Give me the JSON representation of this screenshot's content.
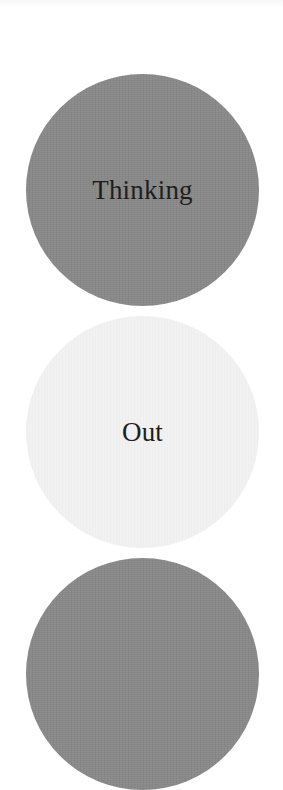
{
  "buttons": [
    {
      "label": "Thinking",
      "state": "selected",
      "fill": "#898989"
    },
    {
      "label": "Out",
      "state": "unselected",
      "fill": "#f1f1f1"
    },
    {
      "label": "",
      "state": "selected",
      "fill": "#898989"
    }
  ],
  "colors": {
    "background": "#ffffff",
    "selected_fill": "#898989",
    "unselected_fill": "#f1f1f1",
    "label_text": "#1e1e1e"
  }
}
